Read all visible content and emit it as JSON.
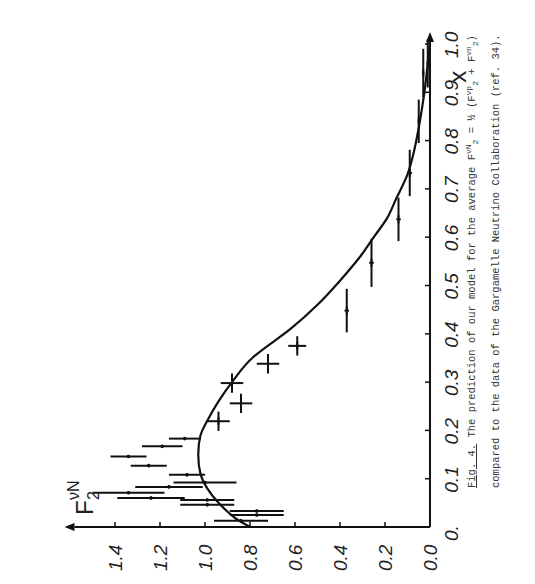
{
  "figure": {
    "label": "Fig. 4.",
    "caption_line1": "The prediction of our model for the average",
    "caption_formula_lhs": "F",
    "caption_formula_lhs_sup": "νN",
    "caption_formula_lhs_sub": "2",
    "caption_formula_eq": "= ½",
    "caption_formula_paren_open": "(F",
    "caption_formula_t1_sup": "νp",
    "caption_formula_t1_sub": "2",
    "caption_formula_plus": "+ F",
    "caption_formula_t2_sup": "νn",
    "caption_formula_t2_sub": "2",
    "caption_formula_paren_close": ")",
    "caption_line2": "compared to the data of the Gargamelle Neutrino Collaboration (ref. 34)."
  },
  "chart_data": {
    "type": "scatter",
    "title": "",
    "xlabel": "x",
    "ylabel": "F2^νN",
    "ylabel_main": "F",
    "ylabel_sub": "2",
    "ylabel_sup": "νN",
    "xlim": [
      0,
      1.0
    ],
    "ylim": [
      0,
      1.55
    ],
    "x_ticks": [
      0.0,
      0.1,
      0.2,
      0.3,
      0.4,
      0.5,
      0.6,
      0.7,
      0.8,
      0.9,
      1.0
    ],
    "x_tick_labels": [
      "0.",
      "0.1",
      "0.2",
      "0.3",
      "0.4",
      "0.5",
      "0.6",
      "0.7",
      "0.8",
      "0.9",
      "1.0"
    ],
    "y_ticks": [
      0.0,
      0.2,
      0.4,
      0.6,
      0.8,
      1.0,
      1.2,
      1.4
    ],
    "y_tick_labels": [
      "0.0",
      "0.2",
      "0.4",
      "0.6",
      "0.8",
      "1.0",
      "1.2",
      "1.4"
    ],
    "grid": false,
    "rotation": "figure rotated 90° counter-clockwise on page",
    "series": [
      {
        "name": "Model prediction",
        "kind": "line",
        "x": [
          0.0,
          0.02,
          0.05,
          0.08,
          0.11,
          0.15,
          0.19,
          0.22,
          0.26,
          0.3,
          0.35,
          0.41,
          0.46,
          0.51,
          0.56,
          0.6,
          0.64,
          0.68,
          0.73,
          0.78,
          0.84,
          0.9,
          0.95,
          1.0
        ],
        "y": [
          0.8,
          0.87,
          0.94,
          0.99,
          1.02,
          1.03,
          1.02,
          0.99,
          0.94,
          0.88,
          0.79,
          0.62,
          0.5,
          0.4,
          0.31,
          0.25,
          0.19,
          0.15,
          0.1,
          0.07,
          0.045,
          0.025,
          0.012,
          0.0
        ]
      },
      {
        "name": "Gargamelle data",
        "kind": "errorbar",
        "points": [
          {
            "x": 0.013,
            "y": 0.84,
            "xerr": 0.003,
            "yerr": 0.12
          },
          {
            "x": 0.025,
            "y": 0.77,
            "xerr": 0.003,
            "yerr": 0.12
          },
          {
            "x": 0.033,
            "y": 0.77,
            "xerr": 0.003,
            "yerr": 0.12
          },
          {
            "x": 0.046,
            "y": 0.99,
            "xerr": 0.003,
            "yerr": 0.12
          },
          {
            "x": 0.056,
            "y": 0.99,
            "xerr": 0.003,
            "yerr": 0.12
          },
          {
            "x": 0.06,
            "y": 1.24,
            "xerr": 0.003,
            "yerr": 0.15
          },
          {
            "x": 0.071,
            "y": 1.34,
            "xerr": 0.003,
            "yerr": 0.16
          },
          {
            "x": 0.083,
            "y": 1.16,
            "xerr": 0.003,
            "yerr": 0.15
          },
          {
            "x": 0.092,
            "y": 1.0,
            "xerr": 0.003,
            "yerr": 0.14
          },
          {
            "x": 0.108,
            "y": 1.08,
            "xerr": 0.003,
            "yerr": 0.08
          },
          {
            "x": 0.127,
            "y": 1.25,
            "xerr": 0.003,
            "yerr": 0.08
          },
          {
            "x": 0.146,
            "y": 1.34,
            "xerr": 0.003,
            "yerr": 0.08
          },
          {
            "x": 0.167,
            "y": 1.19,
            "xerr": 0.003,
            "yerr": 0.09
          },
          {
            "x": 0.183,
            "y": 1.09,
            "xerr": 0.003,
            "yerr": 0.07
          },
          {
            "x": 0.219,
            "y": 0.94,
            "xerr": 0.02,
            "yerr": 0.05
          },
          {
            "x": 0.256,
            "y": 0.84,
            "xerr": 0.02,
            "yerr": 0.05
          },
          {
            "x": 0.298,
            "y": 0.88,
            "xerr": 0.02,
            "yerr": 0.05
          },
          {
            "x": 0.338,
            "y": 0.72,
            "xerr": 0.02,
            "yerr": 0.05
          },
          {
            "x": 0.375,
            "y": 0.59,
            "xerr": 0.02,
            "yerr": 0.04
          },
          {
            "x": 0.448,
            "y": 0.37,
            "xerr": 0.045,
            "yerr": 0.01
          },
          {
            "x": 0.547,
            "y": 0.26,
            "xerr": 0.05,
            "yerr": 0.01
          },
          {
            "x": 0.637,
            "y": 0.14,
            "xerr": 0.045,
            "yerr": 0.01
          },
          {
            "x": 0.733,
            "y": 0.09,
            "xerr": 0.048,
            "yerr": 0.01
          },
          {
            "x": 0.84,
            "y": 0.05,
            "xerr": 0.045,
            "yerr": 0.005
          },
          {
            "x": 0.94,
            "y": 0.03,
            "xerr": 0.05,
            "yerr": 0.005
          },
          {
            "x": 0.96,
            "y": 0.01,
            "xerr": 0.05,
            "yerr": 0.005
          }
        ]
      }
    ]
  }
}
